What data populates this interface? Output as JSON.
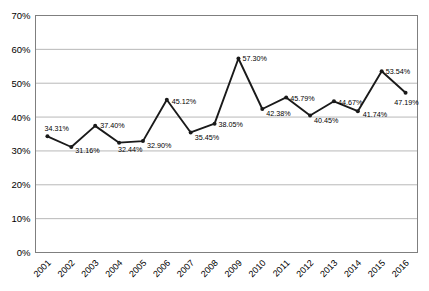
{
  "chart_data": {
    "type": "line",
    "title": "",
    "xlabel": "",
    "ylabel": "",
    "categories": [
      "2001",
      "2002",
      "2003",
      "2004",
      "2005",
      "2006",
      "2007",
      "2008",
      "2009",
      "2010",
      "2011",
      "2012",
      "2013",
      "2014",
      "2015",
      "2016"
    ],
    "values": [
      34.31,
      31.16,
      37.4,
      32.44,
      32.9,
      45.12,
      35.45,
      38.05,
      57.3,
      42.38,
      45.79,
      40.45,
      44.67,
      41.74,
      53.54,
      47.19
    ],
    "point_labels": [
      "34.31%",
      "31.16%",
      "37.40%",
      "32.44%",
      "32.90%",
      "45.12%",
      "35.45%",
      "38.05%",
      "57.30%",
      "42.38%",
      "45.79%",
      "40.45%",
      "44.67%",
      "41.74%",
      "53.54%",
      "47.19%"
    ],
    "y_tick_labels": [
      "0%",
      "10%",
      "20%",
      "30%",
      "40%",
      "50%",
      "60%",
      "70%"
    ],
    "ylim": [
      0,
      70
    ],
    "y_tick_step": 10,
    "grid": true,
    "legend": "none",
    "line_color": "#1a1a1a",
    "marker_color": "#1a1a1a",
    "grid_color": "#b8b8b8",
    "border_color": "#7f7f7f",
    "text_color": "#000000",
    "background_color": "#ffffff",
    "label_offsets": [
      {
        "dx": -3,
        "dy": -5,
        "anchor": "start"
      },
      {
        "dx": 4,
        "dy": 6,
        "anchor": "start"
      },
      {
        "dx": 5,
        "dy": 2,
        "anchor": "start"
      },
      {
        "dx": -1,
        "dy": 9,
        "anchor": "start"
      },
      {
        "dx": 4,
        "dy": 7,
        "anchor": "start"
      },
      {
        "dx": 5,
        "dy": 4,
        "anchor": "start"
      },
      {
        "dx": 4,
        "dy": 8,
        "anchor": "start"
      },
      {
        "dx": 4,
        "dy": 3,
        "anchor": "start"
      },
      {
        "dx": 4,
        "dy": 3,
        "anchor": "start"
      },
      {
        "dx": 4,
        "dy": 7,
        "anchor": "start"
      },
      {
        "dx": 4,
        "dy": 4,
        "anchor": "start"
      },
      {
        "dx": 4,
        "dy": 7,
        "anchor": "start"
      },
      {
        "dx": 4,
        "dy": 4,
        "anchor": "start"
      },
      {
        "dx": 5,
        "dy": 6,
        "anchor": "start"
      },
      {
        "dx": 4,
        "dy": 3,
        "anchor": "start"
      },
      {
        "dx": 1,
        "dy": 12,
        "anchor": "middle"
      }
    ]
  }
}
